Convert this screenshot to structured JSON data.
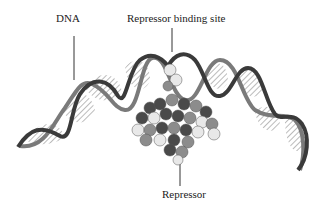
{
  "diagram": {
    "labels": {
      "dna": "DNA",
      "binding_site": "Repressor binding site",
      "repressor": "Repressor"
    },
    "colors": {
      "strand_dark": "#3a3a3a",
      "strand_mid": "#7a7a7a",
      "atom_dark": "#4a4a4a",
      "atom_mid": "#8c8c8c",
      "atom_light": "#e8e8e8"
    }
  }
}
